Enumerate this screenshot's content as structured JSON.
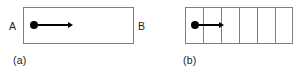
{
  "figure": {
    "background_color": "#ffffff",
    "line_color": "#808080",
    "marker_color": "#000000",
    "text_color": "#1a1a1a",
    "panels": [
      {
        "caption": "(a)",
        "label_left": "A",
        "label_right": "B",
        "cells": 1,
        "box": {
          "x": 23,
          "y": 7,
          "width": 111,
          "height": 37
        },
        "caption_pos": {
          "x": 13,
          "y": 55
        },
        "label_left_pos": {
          "x": 9,
          "y": 21
        },
        "label_right_pos": {
          "x": 138,
          "y": 21
        },
        "particle": {
          "cx": 34,
          "cy": 25,
          "r": 4
        },
        "arrow": {
          "x1": 38,
          "x2": 73,
          "y": 25
        }
      },
      {
        "caption": "(b)",
        "label_left": "",
        "label_right": "",
        "cells": 6,
        "box": {
          "x": 185,
          "y": 7,
          "width": 108,
          "height": 37
        },
        "caption_pos": {
          "x": 183,
          "y": 55
        },
        "dividers": [
          203,
          221,
          239,
          257,
          275
        ],
        "particle": {
          "cx": 195,
          "cy": 25,
          "r": 4
        },
        "arrow": {
          "x1": 199,
          "x2": 224,
          "y": 25
        }
      }
    ]
  }
}
